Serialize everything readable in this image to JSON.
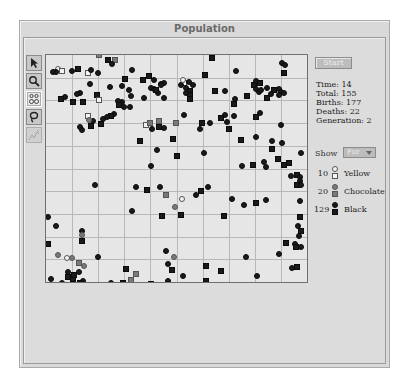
{
  "window": {
    "title": "Population"
  },
  "toolbar": {
    "tools": [
      {
        "name": "pointer-tool",
        "icon": "arrow-pointer-icon"
      },
      {
        "name": "zoom-tool",
        "icon": "magnifier-icon"
      },
      {
        "name": "group-tool",
        "icon": "figures-icon",
        "active": true
      },
      {
        "name": "lasso-tool",
        "icon": "lasso-icon"
      },
      {
        "name": "graph-tool",
        "icon": "graph-icon",
        "disabled": true
      }
    ]
  },
  "controls": {
    "start_label": "Start",
    "stats": {
      "time": "Time: 14",
      "total": "Total: 155",
      "births": "Births: 177",
      "deaths": "Deaths: 22",
      "generation": "Generation: 2"
    },
    "show_label": "Show",
    "show_value": "Fur"
  },
  "legend": [
    {
      "count": "10",
      "label": "Yellow",
      "color": "#f4f4f4"
    },
    {
      "count": "20",
      "label": "Chocolate",
      "color": "#7a7a7a"
    },
    {
      "count": "129",
      "label": "Black",
      "color": "#1a1a1a"
    }
  ],
  "grid": {
    "cols": 10,
    "rows": 10
  },
  "agents": [
    [
      "choc",
      "s",
      53,
      0
    ],
    [
      "black",
      "s",
      62,
      5
    ],
    [
      "choc",
      "s",
      69,
      5
    ],
    [
      "black",
      "c",
      66,
      9
    ],
    [
      "black",
      "s",
      166,
      3
    ],
    [
      "black",
      "c",
      236,
      8
    ],
    [
      "black",
      "c",
      239,
      10
    ],
    [
      "black",
      "c",
      52,
      18
    ],
    [
      "black",
      "s",
      32,
      14
    ],
    [
      "yellow",
      "s",
      42,
      18
    ],
    [
      "black",
      "c",
      26,
      16
    ],
    [
      "black",
      "c",
      45,
      15
    ],
    [
      "yellow",
      "c",
      12,
      14
    ],
    [
      "yellow",
      "s",
      16,
      16
    ],
    [
      "black",
      "c",
      10,
      17
    ],
    [
      "black",
      "c",
      7,
      17
    ],
    [
      "black",
      "c",
      86,
      15
    ],
    [
      "black",
      "s",
      79,
      24
    ],
    [
      "black",
      "c",
      76,
      31
    ],
    [
      "black",
      "c",
      83,
      35
    ],
    [
      "black",
      "c",
      44,
      29
    ],
    [
      "black",
      "c",
      19,
      42
    ],
    [
      "black",
      "s",
      15,
      44
    ],
    [
      "black",
      "c",
      64,
      32
    ],
    [
      "black",
      "c",
      85,
      41
    ],
    [
      "black",
      "s",
      97,
      25
    ],
    [
      "black",
      "s",
      51,
      40
    ],
    [
      "yellow",
      "s",
      53,
      45
    ],
    [
      "black",
      "c",
      98,
      43
    ],
    [
      "black",
      "s",
      103,
      21
    ],
    [
      "black",
      "c",
      108,
      25
    ],
    [
      "black",
      "c",
      115,
      29
    ],
    [
      "black",
      "c",
      118,
      28
    ],
    [
      "black",
      "c",
      115,
      30
    ],
    [
      "black",
      "c",
      105,
      33
    ],
    [
      "black",
      "c",
      108,
      34
    ],
    [
      "black",
      "c",
      112,
      38
    ],
    [
      "black",
      "c",
      118,
      43
    ],
    [
      "black",
      "s",
      110,
      35
    ],
    [
      "yellow",
      "s",
      138,
      28
    ],
    [
      "black",
      "c",
      135,
      30
    ],
    [
      "black",
      "c",
      143,
      27
    ],
    [
      "black",
      "c",
      140,
      33
    ],
    [
      "yellow",
      "c",
      137,
      25
    ],
    [
      "black",
      "s",
      144,
      36
    ],
    [
      "black",
      "s",
      144,
      40
    ],
    [
      "black",
      "s",
      144,
      44
    ],
    [
      "black",
      "c",
      147,
      30
    ],
    [
      "black",
      "c",
      140,
      38
    ],
    [
      "black",
      "c",
      179,
      36
    ],
    [
      "black",
      "c",
      189,
      44
    ],
    [
      "black",
      "s",
      201,
      41
    ],
    [
      "black",
      "s",
      188,
      49
    ],
    [
      "black",
      "s",
      208,
      30
    ],
    [
      "black",
      "c",
      210,
      26
    ],
    [
      "black",
      "c",
      210,
      34
    ],
    [
      "black",
      "c",
      213,
      37
    ],
    [
      "black",
      "c",
      215,
      35
    ],
    [
      "black",
      "s",
      214,
      28
    ],
    [
      "black",
      "c",
      221,
      33
    ],
    [
      "black",
      "s",
      228,
      35
    ],
    [
      "black",
      "c",
      233,
      34
    ],
    [
      "black",
      "c",
      235,
      37
    ],
    [
      "black",
      "c",
      225,
      39
    ],
    [
      "black",
      "s",
      221,
      43
    ],
    [
      "black",
      "c",
      238,
      38
    ],
    [
      "black",
      "c",
      233,
      40
    ],
    [
      "black",
      "s",
      238,
      18
    ],
    [
      "black",
      "c",
      190,
      16
    ],
    [
      "black",
      "s",
      159,
      20
    ],
    [
      "black",
      "s",
      169,
      36
    ],
    [
      "black",
      "s",
      27,
      47
    ],
    [
      "black",
      "s",
      37,
      47
    ],
    [
      "black",
      "c",
      34,
      38
    ],
    [
      "black",
      "c",
      31,
      39
    ],
    [
      "black",
      "c",
      76,
      47
    ],
    [
      "black",
      "c",
      72,
      46
    ],
    [
      "black",
      "s",
      73,
      50
    ],
    [
      "black",
      "c",
      84,
      52
    ],
    [
      "black",
      "c",
      78,
      52
    ],
    [
      "black",
      "c",
      68,
      59
    ],
    [
      "black",
      "s",
      65,
      61
    ],
    [
      "black",
      "c",
      61,
      62
    ],
    [
      "black",
      "c",
      57,
      64
    ],
    [
      "black",
      "s",
      55,
      69
    ],
    [
      "black",
      "s",
      45,
      71
    ],
    [
      "black",
      "c",
      47,
      66
    ],
    [
      "yellow",
      "s",
      42,
      61
    ],
    [
      "choc",
      "c",
      43,
      65
    ],
    [
      "black",
      "c",
      34,
      72
    ],
    [
      "black",
      "c",
      36,
      75
    ],
    [
      "yellow",
      "s",
      100,
      70
    ],
    [
      "choc",
      "s",
      104,
      68
    ],
    [
      "black",
      "c",
      106,
      74
    ],
    [
      "black",
      "s",
      113,
      72
    ],
    [
      "black",
      "c",
      118,
      73
    ],
    [
      "choc",
      "s",
      113,
      66
    ],
    [
      "choc",
      "s",
      130,
      68
    ],
    [
      "black",
      "s",
      94,
      86
    ],
    [
      "black",
      "c",
      138,
      60
    ],
    [
      "black",
      "s",
      127,
      84
    ],
    [
      "black",
      "s",
      156,
      68
    ],
    [
      "black",
      "c",
      164,
      68
    ],
    [
      "black",
      "c",
      154,
      74
    ],
    [
      "black",
      "s",
      131,
      101
    ],
    [
      "black",
      "c",
      111,
      95
    ],
    [
      "black",
      "c",
      105,
      111
    ],
    [
      "black",
      "c",
      179,
      60
    ],
    [
      "black",
      "s",
      175,
      63
    ],
    [
      "black",
      "c",
      188,
      61
    ],
    [
      "black",
      "c",
      181,
      67
    ],
    [
      "black",
      "s",
      183,
      74
    ],
    [
      "black",
      "c",
      158,
      98
    ],
    [
      "black",
      "c",
      214,
      58
    ],
    [
      "black",
      "s",
      210,
      62
    ],
    [
      "black",
      "s",
      195,
      85
    ],
    [
      "black",
      "c",
      210,
      82
    ],
    [
      "black",
      "c",
      226,
      86
    ],
    [
      "black",
      "s",
      226,
      94
    ],
    [
      "black",
      "c",
      235,
      70
    ],
    [
      "black",
      "c",
      236,
      88
    ],
    [
      "black",
      "s",
      232,
      104
    ],
    [
      "black",
      "c",
      255,
      98
    ],
    [
      "black",
      "c",
      196,
      111
    ],
    [
      "black",
      "s",
      207,
      110
    ],
    [
      "black",
      "c",
      218,
      107
    ],
    [
      "black",
      "c",
      220,
      112
    ],
    [
      "black",
      "s",
      238,
      110
    ],
    [
      "black",
      "s",
      243,
      108
    ],
    [
      "black",
      "c",
      245,
      121
    ],
    [
      "black",
      "s",
      251,
      120
    ],
    [
      "black",
      "c",
      254,
      122
    ],
    [
      "black",
      "c",
      254,
      126
    ],
    [
      "black",
      "s",
      251,
      130
    ],
    [
      "black",
      "c",
      255,
      130
    ],
    [
      "black",
      "c",
      254,
      146
    ],
    [
      "black",
      "s",
      254,
      162
    ],
    [
      "black",
      "c",
      252,
      171
    ],
    [
      "black",
      "s",
      255,
      176
    ],
    [
      "black",
      "c",
      253,
      181
    ],
    [
      "black",
      "c",
      249,
      189
    ],
    [
      "black",
      "s",
      250,
      192
    ],
    [
      "black",
      "c",
      255,
      192
    ],
    [
      "black",
      "s",
      240,
      188
    ],
    [
      "black",
      "c",
      233,
      199
    ],
    [
      "choc",
      "c",
      129,
      152
    ],
    [
      "yellow",
      "c",
      136,
      144
    ],
    [
      "black",
      "s",
      135,
      160
    ],
    [
      "black",
      "c",
      186,
      144
    ],
    [
      "black",
      "s",
      178,
      161
    ],
    [
      "black",
      "c",
      198,
      150
    ],
    [
      "black",
      "s",
      210,
      148
    ],
    [
      "black",
      "c",
      220,
      145
    ],
    [
      "black",
      "c",
      162,
      132
    ],
    [
      "black",
      "c",
      150,
      140
    ],
    [
      "black",
      "s",
      155,
      136
    ],
    [
      "black",
      "c",
      90,
      132
    ],
    [
      "black",
      "c",
      49,
      130
    ],
    [
      "black",
      "s",
      101,
      135
    ],
    [
      "choc",
      "s",
      120,
      140
    ],
    [
      "black",
      "c",
      2,
      162
    ],
    [
      "black",
      "c",
      86,
      156
    ],
    [
      "black",
      "c",
      114,
      132
    ],
    [
      "black",
      "s",
      116,
      161
    ],
    [
      "black",
      "s",
      2,
      189
    ],
    [
      "black",
      "c",
      10,
      171
    ],
    [
      "black",
      "c",
      36,
      176
    ],
    [
      "black",
      "s",
      36,
      186
    ],
    [
      "choc",
      "c",
      36,
      180
    ],
    [
      "black",
      "c",
      52,
      202
    ],
    [
      "black",
      "c",
      120,
      196
    ],
    [
      "choc",
      "c",
      128,
      202
    ],
    [
      "black",
      "s",
      126,
      215
    ],
    [
      "black",
      "c",
      137,
      221
    ],
    [
      "black",
      "c",
      122,
      209
    ],
    [
      "black",
      "s",
      80,
      214
    ],
    [
      "black",
      "s",
      160,
      211
    ],
    [
      "black",
      "c",
      200,
      202
    ],
    [
      "black",
      "s",
      175,
      216
    ],
    [
      "choc",
      "c",
      12,
      200
    ],
    [
      "yellow",
      "c",
      21,
      203
    ],
    [
      "choc",
      "c",
      26,
      203
    ],
    [
      "choc",
      "s",
      33,
      208
    ],
    [
      "choc",
      "c",
      38,
      211
    ],
    [
      "black",
      "c",
      5,
      224
    ],
    [
      "black",
      "c",
      16,
      228
    ],
    [
      "black",
      "c",
      22,
      217
    ],
    [
      "black",
      "s",
      22,
      222
    ],
    [
      "black",
      "s",
      27,
      224
    ],
    [
      "black",
      "s",
      28,
      220
    ],
    [
      "black",
      "c",
      33,
      217
    ],
    [
      "black",
      "c",
      37,
      226
    ],
    [
      "black",
      "s",
      34,
      228
    ],
    [
      "black",
      "c",
      65,
      228
    ],
    [
      "black",
      "s",
      77,
      228
    ],
    [
      "choc",
      "s",
      85,
      225
    ],
    [
      "choc",
      "s",
      90,
      219
    ],
    [
      "black",
      "s",
      105,
      229
    ],
    [
      "black",
      "c",
      122,
      226
    ],
    [
      "black",
      "s",
      160,
      226
    ],
    [
      "black",
      "c",
      160,
      229
    ],
    [
      "black",
      "c",
      211,
      221
    ],
    [
      "black",
      "s",
      251,
      212
    ],
    [
      "black",
      "c",
      246,
      213
    ]
  ]
}
